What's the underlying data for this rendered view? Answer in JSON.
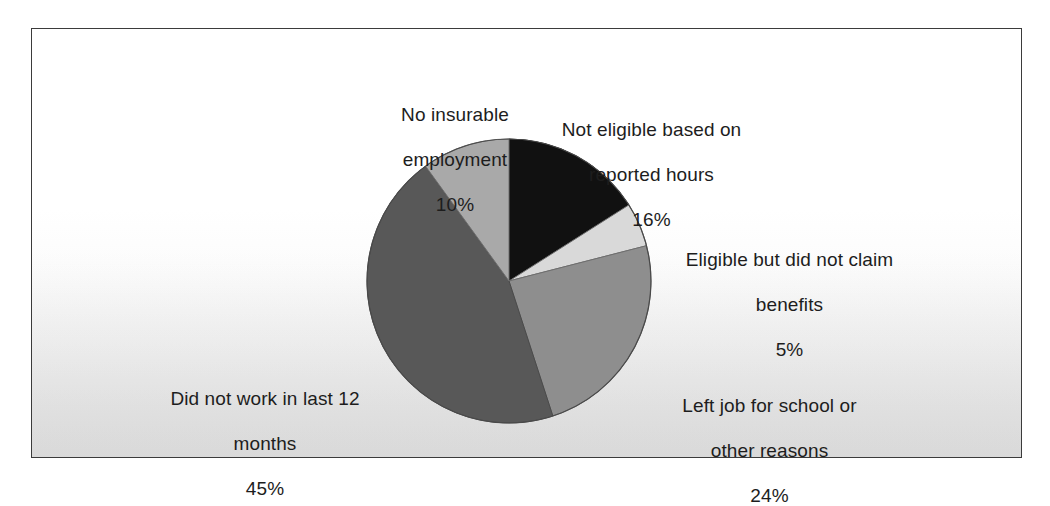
{
  "figure": {
    "background_color": "#ffffff",
    "frame_border_color": "#3b3b3b"
  },
  "chart_data": {
    "type": "pie",
    "title": "",
    "subtitle": "",
    "xlabel": "",
    "ylabel": "",
    "legend_position": "none",
    "grid": false,
    "value_unit": "%",
    "start_angle_deg": 0,
    "direction": "clockwise",
    "categories": [
      "Not eligible based on reported hours",
      "Eligible but did not claim benefits",
      "Left job for school or other reasons",
      "Did not work in last 12 months",
      "No insurable employment"
    ],
    "values": [
      16,
      5,
      24,
      45,
      10
    ],
    "colors": [
      "#111111",
      "#d9d9d9",
      "#8e8e8e",
      "#585858",
      "#a9a9a9"
    ],
    "slices": [
      {
        "label": "Not eligible based on reported hours",
        "label_line1": "Not eligible based on",
        "label_line2": "reported hours",
        "value": 16,
        "percent_text": "16%",
        "color": "#111111",
        "start_deg": 0,
        "end_deg": 57.6
      },
      {
        "label": "Eligible but did not claim benefits",
        "label_line1": "Eligible but did not claim",
        "label_line2": "benefits",
        "value": 5,
        "percent_text": "5%",
        "color": "#d9d9d9",
        "start_deg": 57.6,
        "end_deg": 75.6
      },
      {
        "label": "Left job for school or other reasons",
        "label_line1": "Left job for school or",
        "label_line2": "other reasons",
        "value": 24,
        "percent_text": "24%",
        "color": "#8e8e8e",
        "start_deg": 75.6,
        "end_deg": 162.0
      },
      {
        "label": "Did not work in last 12 months",
        "label_line1": "Did not work in last 12",
        "label_line2": "months",
        "value": 45,
        "percent_text": "45%",
        "color": "#585858",
        "start_deg": 162.0,
        "end_deg": 324.0
      },
      {
        "label": "No insurable employment",
        "label_line1": "No insurable",
        "label_line2": "employment",
        "value": 10,
        "percent_text": "10%",
        "color": "#a9a9a9",
        "start_deg": 324.0,
        "end_deg": 360.0
      }
    ]
  }
}
